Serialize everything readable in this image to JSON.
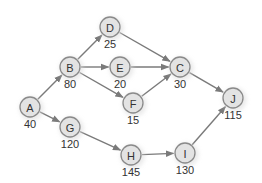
{
  "diagram": {
    "type": "network-diagram",
    "colors": {
      "node_fill": "#e3e3e3",
      "node_stroke": "#8a8a8a",
      "edge": "#7a7a7a",
      "text": "#333333"
    },
    "nodes": [
      {
        "id": "A",
        "label": "A",
        "value": "40",
        "x": 30,
        "y": 107
      },
      {
        "id": "B",
        "label": "B",
        "value": "80",
        "x": 70,
        "y": 67
      },
      {
        "id": "D",
        "label": "D",
        "value": "25",
        "x": 110,
        "y": 27
      },
      {
        "id": "E",
        "label": "E",
        "value": "20",
        "x": 120,
        "y": 67
      },
      {
        "id": "F",
        "label": "F",
        "value": "15",
        "x": 133,
        "y": 103
      },
      {
        "id": "C",
        "label": "C",
        "value": "30",
        "x": 180,
        "y": 67
      },
      {
        "id": "J",
        "label": "J",
        "value": "115",
        "x": 233,
        "y": 98
      },
      {
        "id": "G",
        "label": "G",
        "value": "120",
        "x": 70,
        "y": 127
      },
      {
        "id": "H",
        "label": "H",
        "value": "145",
        "x": 131,
        "y": 155
      },
      {
        "id": "I",
        "label": "I",
        "value": "130",
        "x": 185,
        "y": 153
      }
    ],
    "edges": [
      {
        "from": "A",
        "to": "B"
      },
      {
        "from": "A",
        "to": "G"
      },
      {
        "from": "B",
        "to": "D"
      },
      {
        "from": "B",
        "to": "E"
      },
      {
        "from": "B",
        "to": "F"
      },
      {
        "from": "D",
        "to": "C"
      },
      {
        "from": "E",
        "to": "C"
      },
      {
        "from": "F",
        "to": "C"
      },
      {
        "from": "C",
        "to": "J"
      },
      {
        "from": "G",
        "to": "H"
      },
      {
        "from": "H",
        "to": "I"
      },
      {
        "from": "I",
        "to": "J"
      }
    ]
  }
}
